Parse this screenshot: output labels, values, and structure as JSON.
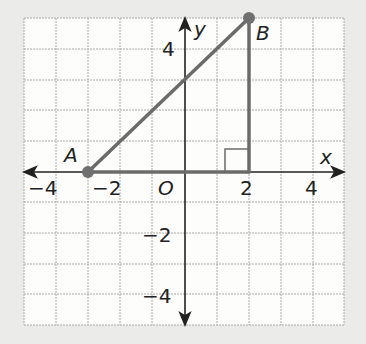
{
  "diagram": {
    "type": "coordinate-plane",
    "x_range": [
      -5,
      5
    ],
    "y_range": [
      -5,
      5
    ],
    "axis_labels": {
      "x": "x",
      "y": "y",
      "origin": "O"
    },
    "x_ticks": [
      {
        "value": -4,
        "label": "−4"
      },
      {
        "value": -2,
        "label": "−2"
      },
      {
        "value": 2,
        "label": "2"
      },
      {
        "value": 4,
        "label": "4"
      }
    ],
    "y_ticks": [
      {
        "value": 4,
        "label": "4"
      },
      {
        "value": -2,
        "label": "−2"
      },
      {
        "value": -4,
        "label": "−4"
      }
    ],
    "points": [
      {
        "name": "A",
        "x": -3,
        "y": 0
      },
      {
        "name": "B",
        "x": 2,
        "y": 5
      }
    ],
    "right_angle_vertex": {
      "x": 2,
      "y": 0
    },
    "colors": {
      "segment": "#6b6b6b",
      "point": "#707070",
      "grid": "#a8a8a8",
      "axis": "#222222",
      "paper": "#fdfdfc"
    }
  }
}
